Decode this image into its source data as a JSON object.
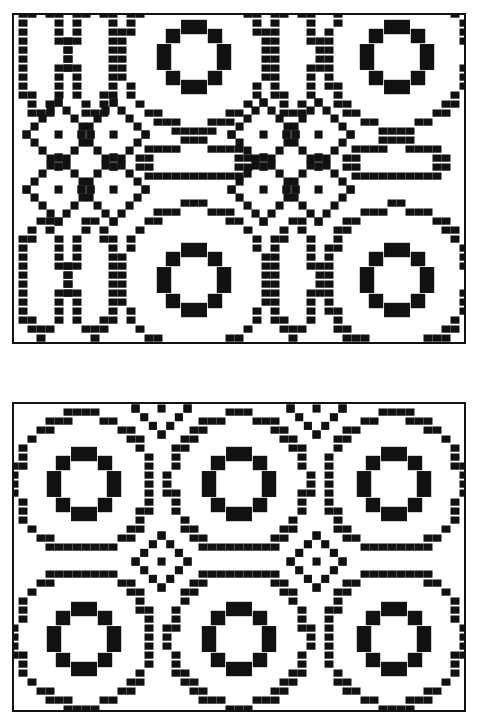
{
  "figure": {
    "ink_color": "#111111",
    "paper_color": "#ffffff",
    "panels": [
      {
        "id": "top",
        "description": "Overshot weave draft pattern: tables (large concentric circles with stepped inner ring) alternating with diamond star blocks and pointed oval shapes",
        "grid_cell_px": 9,
        "motifs": [
          {
            "type": "circle-ring",
            "cx": 180,
            "cy": 42,
            "r_outer": 72,
            "r_inner": 30
          },
          {
            "type": "circle-ring",
            "cx": 383,
            "cy": 42,
            "r_outer": 72,
            "r_inner": 30
          },
          {
            "type": "circle-ring",
            "cx": 180,
            "cy": 265,
            "r_outer": 72,
            "r_inner": 30
          },
          {
            "type": "circle-ring",
            "cx": 383,
            "cy": 265,
            "r_outer": 72,
            "r_inner": 30
          },
          {
            "type": "diamond",
            "cx": 45,
            "cy": 120,
            "r": 32
          },
          {
            "type": "diamond",
            "cx": 100,
            "cy": 120,
            "r": 32
          },
          {
            "type": "diamond",
            "cx": 45,
            "cy": 175,
            "r": 32
          },
          {
            "type": "diamond",
            "cx": 100,
            "cy": 175,
            "r": 32
          },
          {
            "type": "diamond",
            "cx": 250,
            "cy": 120,
            "r": 32
          },
          {
            "type": "diamond",
            "cx": 305,
            "cy": 120,
            "r": 32
          },
          {
            "type": "diamond",
            "cx": 250,
            "cy": 175,
            "r": 32
          },
          {
            "type": "diamond",
            "cx": 305,
            "cy": 175,
            "r": 32
          },
          {
            "type": "oval",
            "cx": 28,
            "cy": 42,
            "rx": 22,
            "ry": 55
          },
          {
            "type": "oval",
            "cx": 80,
            "cy": 42,
            "rx": 22,
            "ry": 55
          },
          {
            "type": "oval",
            "cx": 280,
            "cy": 42,
            "rx": 22,
            "ry": 55
          },
          {
            "type": "oval",
            "cx": 28,
            "cy": 265,
            "rx": 22,
            "ry": 55
          },
          {
            "type": "oval",
            "cx": 80,
            "cy": 265,
            "rx": 22,
            "ry": 55
          },
          {
            "type": "oval",
            "cx": 280,
            "cy": 265,
            "rx": 22,
            "ry": 55
          },
          {
            "type": "oval-h",
            "cx": 180,
            "cy": 148,
            "rx": 50,
            "ry": 18
          },
          {
            "type": "oval-h",
            "cx": 383,
            "cy": 148,
            "rx": 50,
            "ry": 18
          }
        ]
      },
      {
        "id": "bottom",
        "description": "Overshot weave draft pattern: six large concentric circle tables in a 3x2 grid with small diamond stars between them",
        "grid_cell_px": 9,
        "motifs": [
          {
            "type": "circle-ring",
            "cx": 70,
            "cy": 80,
            "r_outer": 68,
            "r_inner": 30
          },
          {
            "type": "circle-ring",
            "cx": 225,
            "cy": 80,
            "r_outer": 68,
            "r_inner": 30
          },
          {
            "type": "circle-ring",
            "cx": 380,
            "cy": 80,
            "r_outer": 68,
            "r_inner": 30
          },
          {
            "type": "circle-ring",
            "cx": 70,
            "cy": 235,
            "r_outer": 68,
            "r_inner": 30
          },
          {
            "type": "circle-ring",
            "cx": 225,
            "cy": 235,
            "r_outer": 68,
            "r_inner": 30
          },
          {
            "type": "circle-ring",
            "cx": 380,
            "cy": 235,
            "r_outer": 68,
            "r_inner": 30
          },
          {
            "type": "diamond",
            "cx": 148,
            "cy": 158,
            "r": 26
          },
          {
            "type": "diamond",
            "cx": 303,
            "cy": 158,
            "r": 26
          },
          {
            "type": "diamond",
            "cx": 148,
            "cy": 5,
            "r": 26
          },
          {
            "type": "diamond",
            "cx": 303,
            "cy": 5,
            "r": 26
          }
        ]
      }
    ]
  }
}
